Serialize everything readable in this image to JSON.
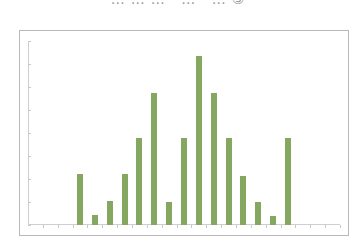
{
  "header": {
    "title_fragment": "……… … …③"
  },
  "chart_data": {
    "type": "bar",
    "title": "",
    "xlabel": "",
    "ylabel": "",
    "grid": false,
    "legend": null,
    "bar_color": "#86a760",
    "slots": 21,
    "categories": [
      "1",
      "2",
      "3",
      "4",
      "5",
      "6",
      "7",
      "8",
      "9",
      "10",
      "11",
      "12",
      "13",
      "14",
      "15",
      "16",
      "17",
      "18",
      "19",
      "20",
      "21"
    ],
    "values": [
      0,
      0,
      0,
      2.2,
      0.45,
      1.05,
      2.2,
      3.8,
      5.75,
      1.0,
      3.8,
      7.35,
      5.75,
      3.8,
      2.15,
      1.0,
      0.4,
      3.8,
      0,
      0,
      0
    ],
    "ylim": [
      0,
      8
    ],
    "y_ticks": [
      0,
      1,
      2,
      3,
      4,
      5,
      6,
      7,
      8
    ],
    "tick_labels_visible": false
  }
}
